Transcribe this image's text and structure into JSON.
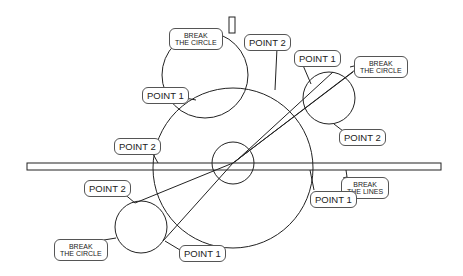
{
  "diagram": {
    "type": "technical-illustration",
    "stroke_color": "#222222",
    "labels": {
      "top_break_circle": "BREAK\nTHE CIRCLE",
      "top_point2": "POINT 2",
      "top_point1": "POINT 1",
      "right_point1": "POINT 1",
      "right_break_circle": "BREAK\nTHE CIRCLE",
      "right_point2": "POINT 2",
      "left_point2": "POINT 2",
      "bar_break_lines": "BREAK\nTHE LINES",
      "big_point1": "POINT 1",
      "bl_point2": "POINT 2",
      "bl_break_circle": "BREAK\nTHE CIRCLE",
      "bl_point1": "POINT 1"
    }
  }
}
